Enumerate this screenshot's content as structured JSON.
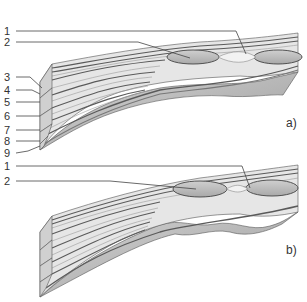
{
  "figure": {
    "colors": {
      "background": "#ffffff",
      "layer_light": "#ececec",
      "layer_mid": "#c8c8c8",
      "layer_dark": "#6a6a6a",
      "body_fill": "#bdbdbd",
      "lens_fill": "#b9b9b9",
      "outline": "#444444",
      "text": "#333333"
    }
  },
  "panel_a": {
    "label": "a)",
    "callouts": [
      {
        "num": "1"
      },
      {
        "num": "2"
      },
      {
        "num": "3"
      },
      {
        "num": "4"
      },
      {
        "num": "5"
      },
      {
        "num": "6"
      },
      {
        "num": "7"
      },
      {
        "num": "8"
      },
      {
        "num": "9"
      }
    ]
  },
  "panel_b": {
    "label": "b)",
    "callouts": [
      {
        "num": "1"
      },
      {
        "num": "2"
      }
    ]
  }
}
